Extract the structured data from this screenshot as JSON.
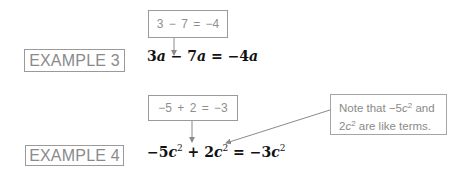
{
  "example3": {
    "label": "EXAMPLE 3",
    "calc": "3 − 7 = −4",
    "equation": {
      "coef1": "3",
      "var1": "a",
      "op": " − ",
      "coef2": "7",
      "var2": "a",
      "eq": " = ",
      "result_coef": "−4",
      "result_var": "a"
    }
  },
  "example4": {
    "label": "EXAMPLE 4",
    "calc": "−5 + 2 = −3",
    "equation": {
      "coef1": "−5",
      "var1": "c",
      "exp1": "2",
      "op": " + ",
      "coef2": "2",
      "var2": "c",
      "exp2": "2",
      "eq": " = ",
      "result_coef": "−3",
      "result_var": "c",
      "result_exp": "2"
    },
    "note": {
      "line1_prefix": "Note that ",
      "term1_coef": "−5",
      "term1_var": "c",
      "term1_exp": "2",
      "line1_suffix": " and",
      "term2_coef": "2",
      "term2_var": "c",
      "term2_exp": "2",
      "line2_suffix": " are like terms."
    }
  },
  "colors": {
    "box_border": "#9a9a9a",
    "box_text": "#8a8a8a",
    "equation_text": "#111111",
    "arrow": "#8a8a8a"
  }
}
